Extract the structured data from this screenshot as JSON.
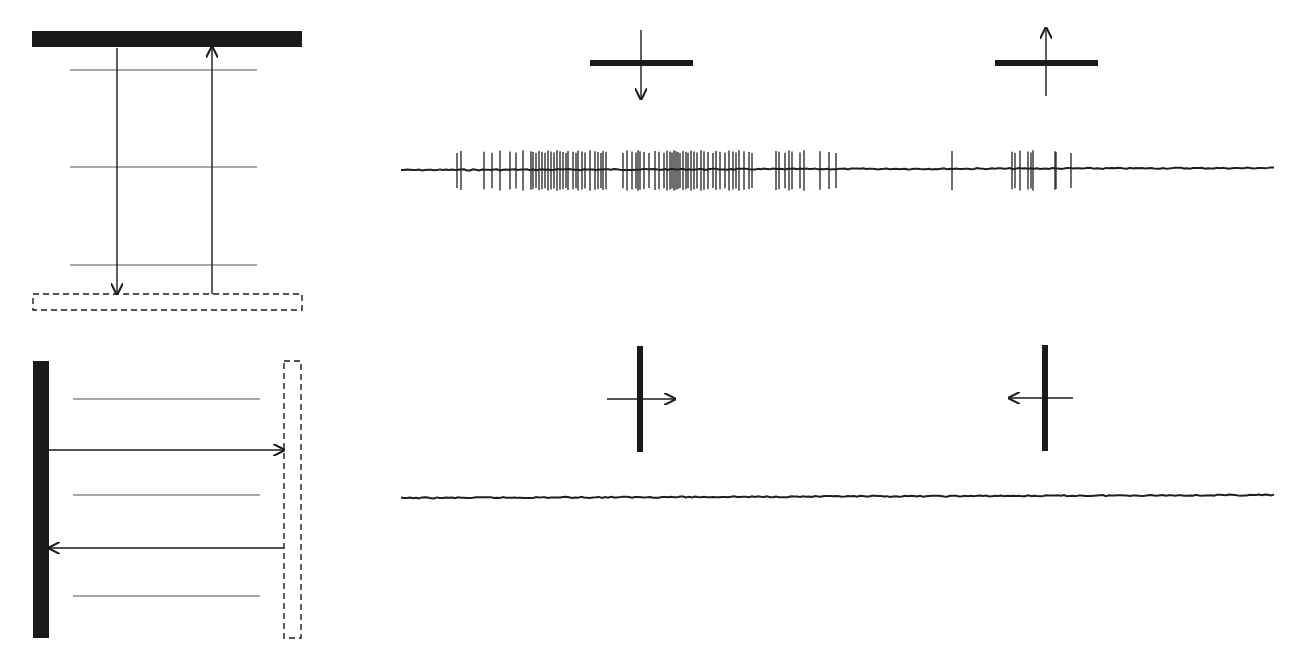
{
  "figure": {
    "panels": [
      {
        "id": "top-left-schematic",
        "description": "Horizontal solid bar at top, dashed bar at bottom, three gray grating lines between, downward arrow and upward arrow between bars",
        "solid_bar": {
          "orientation": "horizontal",
          "x": 32,
          "y": 31,
          "w": 270,
          "h": 16
        },
        "dashed_bar": {
          "x": 33,
          "y": 294,
          "w": 269,
          "h": 16
        },
        "gray_lines_y": [
          70,
          167,
          265
        ],
        "gray_lines_x": [
          70,
          257
        ],
        "arrows": [
          {
            "direction": "down",
            "x": 117,
            "y1": 48,
            "y2": 294
          },
          {
            "direction": "up",
            "x": 212,
            "y1": 294,
            "y2": 47
          }
        ]
      },
      {
        "id": "bottom-left-schematic",
        "description": "Vertical solid bar at left, dashed bar at right, three gray grating lines, rightward arrow and leftward arrow",
        "solid_bar": {
          "orientation": "vertical",
          "x": 33,
          "y": 361,
          "w": 16,
          "h": 277
        },
        "dashed_bar": {
          "x": 284,
          "y": 361,
          "w": 17,
          "h": 277
        },
        "gray_lines_y": [
          399,
          495,
          596
        ],
        "gray_lines_x": [
          73,
          260
        ],
        "arrows": [
          {
            "direction": "right",
            "y": 450,
            "x1": 49,
            "x2": 284
          },
          {
            "direction": "left",
            "y": 548,
            "x1": 284,
            "x2": 49
          }
        ]
      }
    ],
    "stimulus_icons": [
      {
        "id": "bar-horizontal-moving-down",
        "bar_orientation": "horizontal",
        "motion": "down",
        "cx": 641,
        "cy": 63
      },
      {
        "id": "bar-horizontal-moving-up",
        "bar_orientation": "horizontal",
        "motion": "up",
        "cx": 1046,
        "cy": 63
      },
      {
        "id": "bar-vertical-moving-right",
        "bar_orientation": "vertical",
        "motion": "right",
        "cx": 640,
        "cy": 399
      },
      {
        "id": "bar-vertical-moving-left",
        "bar_orientation": "vertical",
        "motion": "left",
        "cx": 1045,
        "cy": 398
      }
    ],
    "traces": [
      {
        "id": "response-trace-vertical-motion",
        "x_start": 401,
        "x_end": 1275,
        "baseline_y": 170,
        "spike_half_height": 20,
        "spikes_x": [
          457,
          461,
          484,
          492,
          500,
          510,
          516,
          523,
          531,
          533,
          536,
          539,
          542,
          545,
          548,
          551,
          554,
          557,
          560,
          563,
          566,
          568,
          573,
          576,
          578,
          582,
          585,
          590,
          595,
          598,
          601,
          603,
          606,
          623,
          627,
          632,
          636,
          638,
          640,
          644,
          649,
          655,
          659,
          664,
          667,
          670,
          672,
          674,
          676,
          678,
          680,
          683,
          686,
          688,
          691,
          694,
          697,
          701,
          704,
          708,
          713,
          716,
          720,
          725,
          729,
          733,
          736,
          739,
          744,
          749,
          752,
          776,
          779,
          785,
          789,
          792,
          800,
          804,
          820,
          829,
          836,
          952,
          1012,
          1015,
          1020,
          1028,
          1031,
          1033,
          1055,
          1056,
          1071
        ]
      },
      {
        "id": "response-trace-horizontal-motion",
        "x_start": 401,
        "x_end": 1275,
        "baseline_y": 498,
        "baseline_y_end": 495,
        "spike_half_height": 0,
        "spikes_x": []
      }
    ]
  }
}
